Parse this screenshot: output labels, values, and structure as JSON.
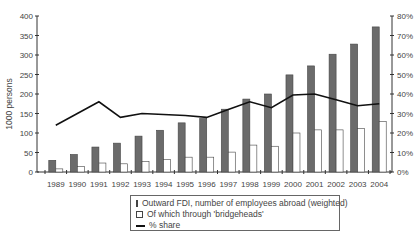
{
  "chart_data": {
    "type": "bar",
    "title": "",
    "xlabel": "",
    "ylabel": "1000 persons",
    "ylabel_right": "",
    "ylim": [
      0,
      400
    ],
    "ylim_right": [
      0,
      0.8
    ],
    "yticks": [
      "0",
      "50",
      "100",
      "150",
      "200",
      "250",
      "300",
      "350",
      "400"
    ],
    "yticks_right": [
      "0%",
      "10%",
      "20%",
      "30%",
      "40%",
      "50%",
      "60%",
      "70%",
      "80%"
    ],
    "grid": false,
    "legend_position": "bottom",
    "categories": [
      "1989",
      "1990",
      "1991",
      "1992",
      "1993",
      "1994",
      "1995",
      "1996",
      "1997",
      "1998",
      "1999",
      "2000",
      "2001",
      "2002",
      "2003",
      "2004"
    ],
    "series": [
      {
        "name": "Outward FDI, number of employees abroad (weighted)",
        "type": "bar",
        "axis": "left",
        "color": "#6b6b6b",
        "values": [
          30,
          45,
          64,
          74,
          92,
          107,
          126,
          137,
          161,
          187,
          200,
          249,
          272,
          302,
          328,
          372
        ]
      },
      {
        "name": "Of which through 'bridgeheads'",
        "type": "bar",
        "axis": "left",
        "color": "#ffffff",
        "values": [
          8,
          14,
          23,
          21,
          27,
          32,
          38,
          38,
          51,
          69,
          66,
          100,
          108,
          108,
          112,
          130
        ]
      },
      {
        "name": "% share",
        "type": "line",
        "axis": "right",
        "color": "#111111",
        "values": [
          24,
          30,
          36,
          28,
          30,
          29.5,
          29,
          28,
          32,
          36,
          33,
          39.5,
          40,
          37,
          34,
          35
        ]
      }
    ]
  },
  "legend": {
    "items": [
      {
        "label": "Outward FDI, number of employees abroad (weighted)",
        "swatch": "filled"
      },
      {
        "label": "Of which through  'bridgeheads'",
        "swatch": "empty"
      },
      {
        "label": "% share",
        "swatch": "line"
      }
    ]
  }
}
